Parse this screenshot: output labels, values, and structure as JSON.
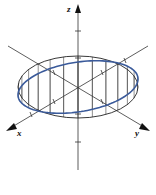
{
  "diagram": {
    "title": "",
    "axes": [
      {
        "name": "z",
        "label": "z"
      },
      {
        "name": "x",
        "label": "x"
      },
      {
        "name": "y",
        "label": "y"
      }
    ],
    "colors": {
      "curve": "#3a5a9a",
      "axes": "#333333",
      "ellipse": "#222222"
    }
  }
}
